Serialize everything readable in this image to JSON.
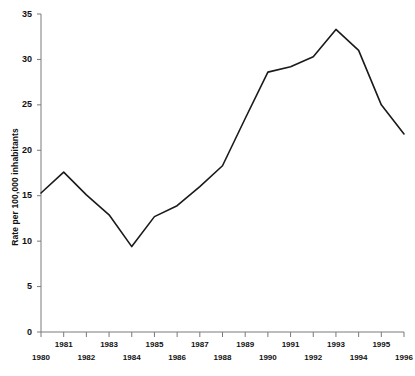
{
  "chart_data": {
    "type": "line",
    "title": "",
    "subtitle": "",
    "xlabel": "",
    "ylabel": "Rate per 100,000 inhabitants",
    "x": [
      1980,
      1981,
      1982,
      1983,
      1984,
      1985,
      1986,
      1987,
      1988,
      1989,
      1990,
      1991,
      1992,
      1993,
      1994,
      1995,
      1996
    ],
    "values": [
      15.3,
      17.6,
      15.1,
      12.9,
      9.4,
      12.7,
      13.9,
      16.0,
      18.3,
      23.5,
      28.6,
      29.2,
      30.3,
      33.3,
      31.0,
      25.0,
      21.8
    ],
    "series": [
      {
        "name": "Rate per 100,000 inhabitants",
        "color": "#1a1a1a",
        "values": [
          15.3,
          17.6,
          15.1,
          12.9,
          9.4,
          12.7,
          13.9,
          16.0,
          18.3,
          23.5,
          28.6,
          29.2,
          30.3,
          33.3,
          31.0,
          25.0,
          21.8
        ]
      }
    ],
    "xlim": [
      1980,
      1996
    ],
    "ylim": [
      0,
      35
    ],
    "yticks": [
      0,
      5,
      10,
      15,
      20,
      25,
      30,
      35
    ],
    "ytick_labels": [
      "0",
      "5",
      "10",
      "15",
      "20",
      "25",
      "30",
      "35"
    ],
    "xticks": [
      1980,
      1981,
      1982,
      1983,
      1984,
      1985,
      1986,
      1987,
      1988,
      1989,
      1990,
      1991,
      1992,
      1993,
      1994,
      1995,
      1996
    ],
    "xtick_labels": [
      "1980",
      "1981",
      "1982",
      "1983",
      "1984",
      "1985",
      "1986",
      "1987",
      "1988",
      "1989",
      "1990",
      "1991",
      "1992",
      "1993",
      "1994",
      "1995",
      "1996"
    ],
    "xtick_label_rows": [
      1,
      0,
      1,
      0,
      1,
      0,
      1,
      0,
      1,
      0,
      1,
      0,
      1,
      0,
      1,
      0,
      1
    ],
    "grid": false,
    "legend": false,
    "legend_position": "none",
    "annotations": [],
    "line_color": "#1a1a1a",
    "line_width": 1.6,
    "axis_color": "#7a7a7a",
    "background": "#ffffff"
  },
  "axis": {
    "y_title": "Rate per 100,000 inhabitants",
    "y_ticks": [
      "0",
      "5",
      "10",
      "15",
      "20",
      "25",
      "30",
      "35"
    ],
    "x_ticks_upper": [
      "1981",
      "1983",
      "1985",
      "1987",
      "1989",
      "1991",
      "1993",
      "1995"
    ],
    "x_ticks_lower": [
      "1980",
      "1982",
      "1984",
      "1986",
      "1988",
      "1990",
      "1992",
      "1994",
      "1996"
    ]
  }
}
